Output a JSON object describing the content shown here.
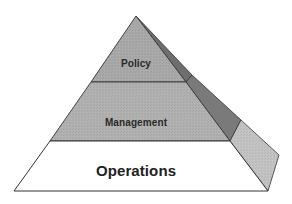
{
  "diagram": {
    "type": "pyramid",
    "levels": [
      {
        "label": "Policy",
        "position": "top",
        "fill": "#a8a8a8",
        "side_fill": "#6e6e6e"
      },
      {
        "label": "Management",
        "position": "middle",
        "fill": "#b0b0b0",
        "side_fill": "#7a7a7a"
      },
      {
        "label": "Operations",
        "position": "bottom",
        "fill": "#ffffff",
        "side_fill": "#c2c2c2"
      }
    ],
    "colors": {
      "outline": "#333333",
      "background": "#ffffff"
    }
  }
}
